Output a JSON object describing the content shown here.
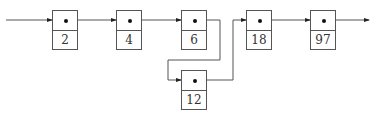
{
  "diagram": {
    "type": "linked-list-insertion",
    "nodes": [
      {
        "id": "n1",
        "value": "2"
      },
      {
        "id": "n2",
        "value": "4"
      },
      {
        "id": "n3",
        "value": "6"
      },
      {
        "id": "n4",
        "value": "18"
      },
      {
        "id": "n5",
        "value": "97"
      },
      {
        "id": "n6",
        "value": "12"
      }
    ],
    "edges": [
      {
        "from": "head",
        "to": "n1"
      },
      {
        "from": "n1",
        "to": "n2"
      },
      {
        "from": "n2",
        "to": "n3"
      },
      {
        "from": "n3",
        "to": "n6"
      },
      {
        "from": "n6",
        "to": "n4"
      },
      {
        "from": "n4",
        "to": "n5"
      },
      {
        "from": "n5",
        "to": "tail"
      }
    ],
    "colors": {
      "line": "#555555",
      "dot": "#111111",
      "text": "#333333"
    }
  }
}
